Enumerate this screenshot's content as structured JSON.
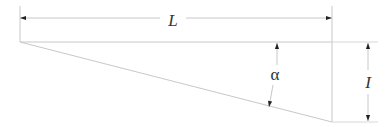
{
  "diagram": {
    "type": "geometry-right-triangle-dimension",
    "labels": {
      "length": "L",
      "angle": "α",
      "height": "I"
    },
    "colors": {
      "line": "#c8c8c8",
      "arrow": "#222222",
      "text": "#333333",
      "background": "#ffffff"
    },
    "geometry": {
      "top_left": [
        20,
        42
      ],
      "top_right": [
        332,
        42
      ],
      "bottom_right": [
        332,
        122
      ],
      "dim_L_y": 18,
      "dim_I_x": 368
    }
  }
}
